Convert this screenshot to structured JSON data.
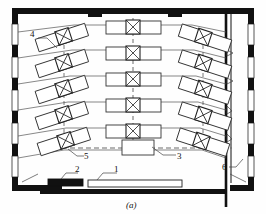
{
  "figure": {
    "caption": "(a)",
    "type": "architectural-floor-plan"
  },
  "callouts": [
    {
      "id": "1",
      "label": "1",
      "x": 117,
      "y": 168,
      "target": "platform-stage"
    },
    {
      "id": "2",
      "label": "2",
      "x": 78,
      "y": 168,
      "target": "blackboard"
    },
    {
      "id": "3",
      "label": "3",
      "x": 178,
      "y": 156,
      "target": "lectern"
    },
    {
      "id": "4",
      "label": "4",
      "x": 32,
      "y": 35,
      "target": "desk-unit-left"
    },
    {
      "id": "5",
      "label": "5",
      "x": 85,
      "y": 156,
      "target": "desk-unit-angled"
    },
    {
      "id": "6",
      "label": "6",
      "x": 224,
      "y": 167,
      "target": "partition-wall"
    }
  ],
  "colors": {
    "wall_fill": "#111111",
    "line": "#3a3a3a",
    "paper": "#fefefe",
    "blackboard": "#111111",
    "dash": "#6a6a6a"
  },
  "rooms": {
    "main": {
      "name": "lecture-room"
    },
    "corridor": {
      "name": "corridor"
    }
  },
  "desk_rows": {
    "count": 6,
    "center_unit_count": 6,
    "left_unit_count": 6,
    "right_unit_count": 6,
    "fixture_symbol": "crossed-box"
  },
  "elements": {
    "platform": {
      "name": "platform-stage"
    },
    "blackboard": {
      "name": "blackboard"
    },
    "lectern": {
      "name": "lectern"
    },
    "partition": {
      "name": "partition-wall"
    },
    "centerline": {
      "name": "center-axis-dashed"
    }
  }
}
